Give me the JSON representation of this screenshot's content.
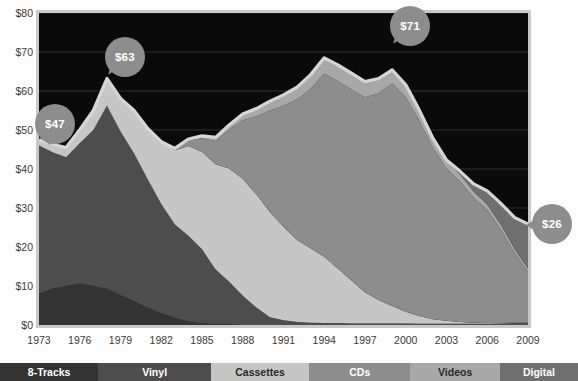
{
  "chart_data": {
    "type": "area",
    "title": "",
    "subtitle": "",
    "xlabel": "",
    "ylabel": "",
    "stacked": true,
    "grid": true,
    "legend_position": "bottom",
    "xlim": [
      1973,
      2009
    ],
    "ylim": [
      0,
      80
    ],
    "ytick_labels": [
      "$80",
      "$70",
      "$60",
      "$50",
      "$40",
      "$30",
      "$20",
      "$10",
      "$0"
    ],
    "ytick_values": [
      80,
      70,
      60,
      50,
      40,
      30,
      20,
      10,
      0
    ],
    "xtick_labels": [
      "1973",
      "1976",
      "1979",
      "1982",
      "1985",
      "1988",
      "1991",
      "1994",
      "1997",
      "2000",
      "2003",
      "2006",
      "2009"
    ],
    "xtick_values": [
      1973,
      1976,
      1979,
      1982,
      1985,
      1988,
      1991,
      1994,
      1997,
      2000,
      2003,
      2006,
      2009
    ],
    "x": [
      1973,
      1974,
      1975,
      1976,
      1977,
      1978,
      1979,
      1980,
      1981,
      1982,
      1983,
      1984,
      1985,
      1986,
      1987,
      1988,
      1989,
      1990,
      1991,
      1992,
      1993,
      1994,
      1995,
      1996,
      1997,
      1998,
      1999,
      2000,
      2001,
      2002,
      2003,
      2004,
      2005,
      2006,
      2007,
      2008,
      2009
    ],
    "series": [
      {
        "name": "8-Tracks",
        "color": "#333333",
        "values": [
          8.0,
          9.3,
          10.0,
          10.6,
          10.0,
          9.2,
          7.6,
          6.0,
          4.4,
          3.0,
          1.8,
          0.9,
          0.4,
          0.2,
          0.1,
          0.0,
          0.0,
          0.0,
          0.0,
          0.0,
          0.0,
          0.0,
          0.0,
          0.0,
          0.0,
          0.0,
          0.0,
          0.0,
          0.0,
          0.0,
          0.0,
          0.0,
          0.0,
          0.0,
          0.0,
          0.0,
          0.0
        ]
      },
      {
        "name": "Vinyl",
        "color": "#4d4d4d",
        "values": [
          38.0,
          35.0,
          33.0,
          36.0,
          40.0,
          47.0,
          42.0,
          38.0,
          33.0,
          28.0,
          24.0,
          22.0,
          19.0,
          14.0,
          11.0,
          7.5,
          4.5,
          2.0,
          1.2,
          0.8,
          0.6,
          0.5,
          0.5,
          0.4,
          0.4,
          0.4,
          0.4,
          0.4,
          0.3,
          0.3,
          0.3,
          0.3,
          0.3,
          0.3,
          0.4,
          0.5,
          0.6
        ]
      },
      {
        "name": "Cassettes",
        "color": "#c6c6c6",
        "values": [
          1.5,
          2.0,
          2.5,
          3.5,
          5.0,
          7.0,
          8.5,
          11.0,
          13.0,
          16.0,
          19.0,
          23.0,
          25.0,
          27.0,
          29.0,
          30.0,
          29.0,
          27.0,
          24.0,
          21.0,
          19.0,
          17.0,
          14.0,
          11.0,
          8.0,
          6.0,
          4.5,
          3.0,
          2.0,
          1.2,
          0.8,
          0.5,
          0.3,
          0.2,
          0.1,
          0.1,
          0.0
        ]
      },
      {
        "name": "CDs",
        "color": "#8d8d8d",
        "values": [
          0.0,
          0.0,
          0.0,
          0.0,
          0.0,
          0.0,
          0.0,
          0.0,
          0.0,
          0.0,
          0.5,
          1.5,
          3.5,
          6.0,
          10.0,
          15.0,
          20.0,
          26.0,
          31.0,
          36.0,
          41.0,
          47.0,
          48.0,
          49.0,
          50.0,
          53.0,
          57.0,
          55.0,
          50.0,
          44.0,
          39.0,
          36.0,
          32.0,
          29.0,
          24.0,
          18.0,
          13.0
        ]
      },
      {
        "name": "Videos",
        "color": "#a8a8a8",
        "values": [
          0.0,
          0.0,
          0.0,
          0.0,
          0.0,
          0.0,
          0.0,
          0.0,
          0.0,
          0.0,
          0.0,
          0.3,
          0.6,
          0.9,
          1.2,
          1.6,
          2.0,
          2.4,
          2.8,
          3.2,
          3.6,
          4.0,
          4.2,
          4.2,
          4.0,
          3.8,
          3.5,
          3.2,
          2.8,
          2.4,
          2.0,
          1.8,
          1.6,
          1.4,
          1.2,
          1.0,
          0.8
        ]
      },
      {
        "name": "Digital",
        "color": "#6f6f6f",
        "values": [
          0.0,
          0.0,
          0.0,
          0.0,
          0.0,
          0.0,
          0.0,
          0.0,
          0.0,
          0.0,
          0.0,
          0.0,
          0.0,
          0.0,
          0.0,
          0.0,
          0.0,
          0.0,
          0.0,
          0.0,
          0.0,
          0.0,
          0.0,
          0.0,
          0.0,
          0.0,
          0.0,
          0.0,
          0.0,
          0.0,
          0.2,
          0.8,
          2.0,
          3.5,
          5.5,
          8.0,
          11.5
        ]
      }
    ],
    "total_line": {
      "name": "Total revenue",
      "color": "#d6d6d6",
      "values": [
        47.5,
        46.3,
        45.5,
        50.1,
        55.0,
        63.2,
        58.1,
        55.0,
        50.4,
        47.0,
        45.3,
        47.7,
        48.5,
        48.1,
        51.3,
        54.1,
        55.5,
        57.4,
        59.0,
        61.0,
        64.2,
        68.5,
        66.7,
        64.6,
        62.4,
        63.2,
        65.4,
        61.6,
        55.1,
        47.9,
        42.3,
        39.4,
        36.2,
        34.4,
        31.2,
        27.6,
        25.9
      ]
    },
    "annotations": [
      {
        "label": "$47",
        "year": 1973,
        "value": 47,
        "tail": "down-right"
      },
      {
        "label": "$63",
        "year": 1978,
        "value": 63,
        "tail": "down-left"
      },
      {
        "label": "$71",
        "year": 1999,
        "value": 71,
        "tail": "down-left"
      },
      {
        "label": "$26",
        "year": 2009,
        "value": 26,
        "tail": "left"
      }
    ],
    "annotation_style": {
      "fill": "#8d8d8d",
      "text_color": "#ffffff"
    }
  },
  "legend": {
    "items": [
      {
        "label": "8-Tracks",
        "color": "#333333",
        "text_color": "#ffffff",
        "width_pct": 17.0
      },
      {
        "label": "Vinyl",
        "color": "#4d4d4d",
        "text_color": "#ffffff",
        "width_pct": 19.5
      },
      {
        "label": "Cassettes",
        "color": "#c6c6c6",
        "text_color": "#2a2a2a",
        "width_pct": 17.0
      },
      {
        "label": "CDs",
        "color": "#8d8d8d",
        "text_color": "#ffffff",
        "width_pct": 17.5
      },
      {
        "label": "Videos",
        "color": "#a8a8a8",
        "text_color": "#2a2a2a",
        "width_pct": 15.5
      },
      {
        "label": "Digital",
        "color": "#6f6f6f",
        "text_color": "#ffffff",
        "width_pct": 13.5
      }
    ]
  },
  "style": {
    "plot_background": "#0a0a0a",
    "page_background": "#fdfdfd",
    "axis_text_color": "#3b3b3b",
    "frame_color": "#c9c9c9"
  }
}
